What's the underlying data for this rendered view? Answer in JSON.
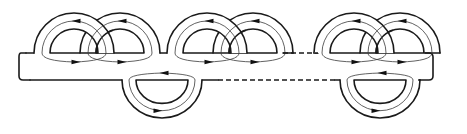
{
  "diagram": {
    "title": "",
    "colors": {
      "stroke": "#1a1a1a",
      "curve": "#3a3a3a",
      "background": "#ffffff"
    },
    "strip": {
      "left": 20,
      "right": 431,
      "top": 53,
      "bottom": 80
    },
    "upper_pairs": [
      {
        "id": "pair-1",
        "left_center_x": 74,
        "right_center_x": 120,
        "baseline_y": 53
      },
      {
        "id": "pair-2",
        "left_center_x": 207,
        "right_center_x": 253,
        "baseline_y": 53
      },
      {
        "id": "pair-3",
        "left_center_x": 354,
        "right_center_x": 400,
        "baseline_y": 53
      }
    ],
    "lower_bands": [
      {
        "id": "lower-1",
        "center_x": 162,
        "baseline_y": 80
      },
      {
        "id": "lower-2",
        "center_x": 380,
        "baseline_y": 80
      }
    ],
    "ellipsis_segments": [
      {
        "id": "dash-top",
        "x1": 283,
        "x2": 318,
        "y": 53
      },
      {
        "id": "dash-bottom",
        "x1": 218,
        "x2": 335,
        "y": 80
      }
    ],
    "arrow_glyph": "filled-triangle",
    "labels": []
  }
}
